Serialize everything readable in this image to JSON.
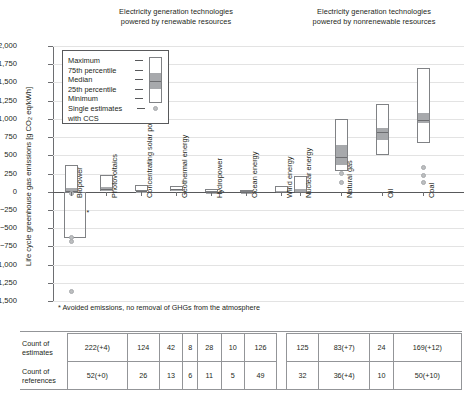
{
  "figure": {
    "panels": [
      {
        "id": "renewable",
        "title": "Electricity generation technologies\npowered by renewable resources"
      },
      {
        "id": "nonrenewable",
        "title": "Electricity generation technologies\npowered by nonrenewable resources"
      }
    ],
    "title_renewable_line1": "Electricity generation technologies",
    "title_renewable_line2": "powered by renewable resources",
    "title_nonrenewable_line1": "Electricity generation technologies",
    "title_nonrenewable_line2": "powered by nonrenewable resources",
    "ylabel_pre": "Life cycle greenhouse gas emissions [g CO",
    "ylabel_sub": "2",
    "ylabel_post": " eq/kWh]",
    "footnote": "* Avoided emissions, no removal of GHGs from the atmosphere",
    "negative_marker": "*"
  },
  "legend": {
    "rows": [
      {
        "label": "Maximum"
      },
      {
        "label": "75th percentile"
      },
      {
        "label": "Median"
      },
      {
        "label": "25th percentile"
      },
      {
        "label": "Minimum"
      },
      {
        "label": "Single estimates"
      },
      {
        "label": "with CCS"
      }
    ]
  },
  "chart_data": {
    "type": "bar",
    "xlabel": "",
    "ylabel": "Life cycle greenhouse gas emissions [g CO2 eq/kWh]",
    "ylim": [
      -1500,
      2000
    ],
    "ytick_step": 250,
    "grid": true,
    "legend_position": "inside-upper-left",
    "ytick_labels": [
      "2,000",
      "1,750",
      "1,500",
      "1,250",
      "1,000",
      "750",
      "500",
      "250",
      "0",
      "−250",
      "−500",
      "−750",
      "−1,000",
      "−1,250",
      "−1,500"
    ],
    "ytick_values": [
      2000,
      1750,
      1500,
      1250,
      1000,
      750,
      500,
      250,
      0,
      -250,
      -500,
      -750,
      -1000,
      -1250,
      -1500
    ],
    "categories": [
      "Biopower",
      "Photovoltaics",
      "Concentrating solar power",
      "Geothermal energy",
      "Hydropower",
      "Ocean energy",
      "Wind energy",
      "Nuclear energy",
      "Natural gas",
      "Oil",
      "Coal"
    ],
    "panel_of_category": [
      "renewable",
      "renewable",
      "renewable",
      "renewable",
      "renewable",
      "renewable",
      "renewable",
      "nonrenewable",
      "nonrenewable",
      "nonrenewable",
      "nonrenewable"
    ],
    "series": [
      {
        "name": "Maximum",
        "values": [
          360,
          230,
          89,
          80,
          43,
          23,
          81,
          220,
          1000,
          1200,
          1700
        ]
      },
      {
        "name": "75th percentile",
        "values": [
          62,
          80,
          30,
          57,
          7,
          10,
          20,
          45,
          650,
          890,
          1100
        ]
      },
      {
        "name": "Median",
        "values": [
          18,
          46,
          22,
          45,
          4,
          8,
          12,
          16,
          490,
          840,
          1001
        ]
      },
      {
        "name": "25th percentile",
        "values": [
          -360,
          28,
          14,
          20,
          3,
          6,
          8,
          8,
          380,
          720,
          960
        ]
      },
      {
        "name": "Minimum",
        "values": [
          -633,
          5,
          8,
          6,
          1,
          2,
          2,
          1,
          290,
          510,
          675
        ]
      }
    ],
    "ccs_single_estimates": [
      {
        "category": "Biopower",
        "values": [
          -1368,
          -680,
          -633,
          -20
        ]
      },
      {
        "category": "Natural gas",
        "values": [
          245,
          125
        ]
      },
      {
        "category": "Coal",
        "values": [
          330,
          220,
          120
        ]
      }
    ],
    "biopower_negative_note": "Biopower minimum extends to about -633 g CO2 eq/kWh (avoided emissions)"
  },
  "table": {
    "row_labels": [
      {
        "line1": "Count of",
        "line2": "estimates"
      },
      {
        "line1": "Count of",
        "line2": "references"
      }
    ],
    "estimates": [
      "222(+4)",
      "124",
      "42",
      "8",
      "28",
      "10",
      "126",
      "125",
      "83(+7)",
      "24",
      "169(+12)"
    ],
    "references": [
      "52(+0)",
      "26",
      "13",
      "6",
      "11",
      "5",
      "49",
      "32",
      "36(+4)",
      "10",
      "50(+10)"
    ]
  }
}
